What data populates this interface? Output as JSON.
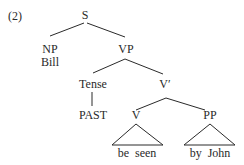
{
  "example_number": "(2)",
  "tree": {
    "S": "S",
    "NP": "NP",
    "NP_word": "Bill",
    "VP": "VP",
    "Tense": "Tense",
    "Tense_value": "PAST",
    "Vbar": "V′",
    "V": "V",
    "V_words": "be  seen",
    "PP": "PP",
    "PP_words": "by  John"
  },
  "edges": [
    [
      "S",
      "NP"
    ],
    [
      "S",
      "VP"
    ],
    [
      "VP",
      "Tense"
    ],
    [
      "VP",
      "Vbar"
    ],
    [
      "Tense",
      "PAST"
    ],
    [
      "Vbar",
      "V"
    ],
    [
      "Vbar",
      "PP"
    ]
  ],
  "triangles": [
    "V: be seen",
    "PP: by John"
  ],
  "colors": {
    "ink": "#2a2a2a",
    "background": "#ffffff"
  }
}
